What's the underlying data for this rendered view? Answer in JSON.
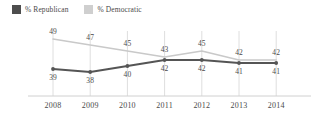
{
  "chart_data": {
    "type": "line",
    "title": "",
    "subtitle": "",
    "xlabel": "",
    "ylabel": "",
    "grid": true,
    "legend_position": "top-left",
    "ylim": [
      36,
      50
    ],
    "categories": [
      "2008",
      "2009",
      "2010",
      "2011",
      "2012",
      "2013",
      "2014"
    ],
    "series": [
      {
        "name": "% Republican",
        "color": "#555555",
        "values": [
          39,
          38,
          40,
          42,
          42,
          41,
          41
        ],
        "label_position": "below"
      },
      {
        "name": "% Democratic",
        "color": "#c9c9c9",
        "values": [
          49,
          47,
          45,
          43,
          45,
          42,
          42
        ],
        "label_position": "above"
      }
    ]
  },
  "legend": {
    "items": [
      {
        "label": "% Republican",
        "swatch_color": "#4d4d4d"
      },
      {
        "label": "% Democratic",
        "swatch_color": "#cfcfcf"
      }
    ]
  },
  "axis": {
    "tick_labels": [
      "2008",
      "2009",
      "2010",
      "2011",
      "2012",
      "2013",
      "2014"
    ],
    "axis_line_color": "#d0d0d0",
    "gridline_color": "#dedede"
  },
  "colors": {
    "republican": "#555555",
    "democratic": "#c9c9c9",
    "background": "#ffffff",
    "text": "#4a4a4a"
  }
}
